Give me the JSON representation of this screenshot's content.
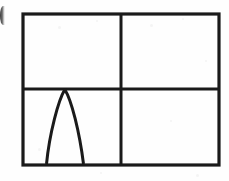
{
  "figure": {
    "background_color": "#fefefe",
    "stroke_color": "#1a1a1a",
    "frame": {
      "label": "outer-rectangle",
      "x": 23,
      "y": 14,
      "width": 196,
      "height": 151,
      "stroke_width": 3.2
    },
    "dividers": {
      "vertical": {
        "label": "vertical-divider",
        "x": 121,
        "y_top": 14,
        "y_bottom": 165,
        "stroke_width": 3.0
      },
      "horizontal": {
        "label": "horizontal-divider",
        "y": 89,
        "x_left": 23,
        "x_right": 219,
        "stroke_width": 3.0
      }
    },
    "quadrants": [
      {
        "name": "top-left",
        "content": "empty"
      },
      {
        "name": "top-right",
        "content": "empty"
      },
      {
        "name": "bottom-left",
        "content": "parabola"
      },
      {
        "name": "bottom-right",
        "content": "empty"
      }
    ],
    "curve": {
      "label": "downward-parabola",
      "type": "parabola",
      "opening": "downward",
      "apex_x": 65,
      "apex_y": 89,
      "left_root_x": 46,
      "right_root_x": 84,
      "baseline_y": 164,
      "stroke_width": 3.0,
      "path": "M 46.5 164 C 49.5 133 58.5 100 64.8 89.5 C 71.5 100 79.5 132 83.5 164"
    }
  },
  "artifacts": {
    "edge_glyph": {
      "label": "cropped-glyph-fragment",
      "x": 0,
      "y": 6,
      "width": 5,
      "height": 19
    },
    "specks": [
      {
        "x": 58,
        "y": 26,
        "size": 3
      },
      {
        "x": 96,
        "y": 20,
        "size": 2
      },
      {
        "x": 150,
        "y": 24,
        "size": 3
      },
      {
        "x": 182,
        "y": 18,
        "size": 2
      },
      {
        "x": 38,
        "y": 148,
        "size": 3
      },
      {
        "x": 170,
        "y": 120,
        "size": 2
      },
      {
        "x": 205,
        "y": 60,
        "size": 2
      },
      {
        "x": 100,
        "y": 172,
        "size": 2
      },
      {
        "x": 196,
        "y": 174,
        "size": 3
      }
    ]
  }
}
